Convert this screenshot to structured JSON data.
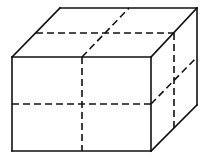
{
  "diagram": {
    "title": "",
    "colors": {
      "stroke": "#111111",
      "background": "#ffffff"
    },
    "vertices": {
      "front_top_left": [
        12,
        57
      ],
      "front_top_right": [
        151,
        57
      ],
      "front_bottom_left": [
        12,
        151
      ],
      "front_bottom_right": [
        151,
        151
      ],
      "back_top_left": [
        60,
        8
      ],
      "back_top_right": [
        197,
        8
      ],
      "back_bottom_right": [
        197,
        105
      ]
    },
    "solid_edges": [
      [
        12,
        57,
        151,
        57
      ],
      [
        151,
        57,
        151,
        151
      ],
      [
        151,
        151,
        12,
        151
      ],
      [
        12,
        151,
        12,
        57
      ],
      [
        12,
        57,
        60,
        8
      ],
      [
        60,
        8,
        197,
        8
      ],
      [
        197,
        8,
        151,
        57
      ],
      [
        197,
        8,
        197,
        105
      ],
      [
        197,
        105,
        151,
        151
      ]
    ],
    "dashed_lines": [
      [
        82,
        57,
        82,
        151
      ],
      [
        12,
        104,
        151,
        104
      ],
      [
        36,
        33,
        174,
        33
      ],
      [
        82,
        57,
        129,
        8
      ],
      [
        174,
        33,
        174,
        129
      ],
      [
        151,
        104,
        197,
        57
      ]
    ]
  }
}
